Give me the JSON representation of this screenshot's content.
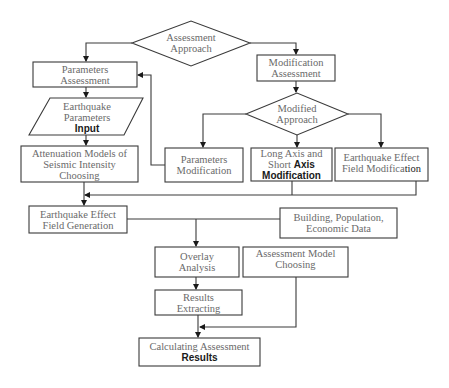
{
  "diagram": {
    "type": "flowchart",
    "colors": {
      "stroke": "#3a3a3a",
      "text": "#6a6a6a",
      "emphasis_text": "#1a1a1a",
      "background": "#ffffff"
    },
    "nodes": {
      "assessment_approach": {
        "shape": "diamond",
        "lines": [
          "Assessment",
          "Approach"
        ]
      },
      "parameters_assessment": {
        "shape": "rect",
        "lines": [
          "Parameters",
          "Assessment"
        ]
      },
      "earthquake_parameters_input": {
        "shape": "parallelogram",
        "lines": [
          "Earthquake",
          "Parameters"
        ],
        "emphasis": "Input"
      },
      "attenuation_models": {
        "shape": "rect",
        "lines": [
          "Attenuation Models of",
          "Seismic Intensity",
          "Choosing"
        ]
      },
      "earthquake_effect_field_generation": {
        "shape": "rect",
        "lines": [
          "Earthquake Effect",
          "Field Generation"
        ]
      },
      "modification_assessment": {
        "shape": "rect",
        "lines": [
          "Modification",
          "Assessment"
        ]
      },
      "modified_approach": {
        "shape": "diamond",
        "lines": [
          "Modified",
          "Approach"
        ]
      },
      "parameters_modification": {
        "shape": "rect",
        "lines": [
          "Parameters",
          "Modification"
        ]
      },
      "long_short_axis_modification": {
        "shape": "rect",
        "lines": [
          "Long Axis and"
        ],
        "line2_plain": "Short",
        "line2_bold": "Axis",
        "emphasis": "Modification"
      },
      "earthquake_effect_field_modification": {
        "shape": "rect",
        "lines": [
          "Earthquake Effect"
        ],
        "line2_plain": "Field Modifica",
        "line2_bold": "tion"
      },
      "building_population_economic": {
        "shape": "rect",
        "lines": [
          "Building, Population,",
          "Economic Data"
        ]
      },
      "overlay_analysis": {
        "shape": "rect",
        "lines": [
          "Overlay",
          "Analysis"
        ]
      },
      "assessment_model_choosing": {
        "shape": "rect",
        "lines": [
          "Assessment Model",
          "Choosing"
        ]
      },
      "results_extracting": {
        "shape": "rect",
        "lines": [
          "Results",
          "Extracting"
        ]
      },
      "calculating_assessment_results": {
        "shape": "rect",
        "lines": [
          "Calculating Assessment"
        ],
        "emphasis": "Results"
      }
    },
    "edges": [
      {
        "from": "assessment_approach",
        "to": "parameters_assessment"
      },
      {
        "from": "assessment_approach",
        "to": "modification_assessment"
      },
      {
        "from": "parameters_assessment",
        "to": "earthquake_parameters_input"
      },
      {
        "from": "earthquake_parameters_input",
        "to": "attenuation_models"
      },
      {
        "from": "attenuation_models",
        "to": "earthquake_effect_field_generation"
      },
      {
        "from": "modification_assessment",
        "to": "modified_approach"
      },
      {
        "from": "modified_approach",
        "to": "parameters_modification"
      },
      {
        "from": "modified_approach",
        "to": "long_short_axis_modification"
      },
      {
        "from": "modified_approach",
        "to": "earthquake_effect_field_modification"
      },
      {
        "from": "parameters_modification",
        "to": "parameters_assessment"
      },
      {
        "from": "long_short_axis_modification",
        "to": "earthquake_effect_field_generation"
      },
      {
        "from": "earthquake_effect_field_modification",
        "to": "earthquake_effect_field_generation"
      },
      {
        "from": "earthquake_effect_field_generation",
        "to": "overlay_analysis"
      },
      {
        "from": "building_population_economic",
        "to": "overlay_analysis"
      },
      {
        "from": "overlay_analysis",
        "to": "results_extracting"
      },
      {
        "from": "results_extracting",
        "to": "calculating_assessment_results"
      },
      {
        "from": "assessment_model_choosing",
        "to": "calculating_assessment_results"
      }
    ]
  }
}
